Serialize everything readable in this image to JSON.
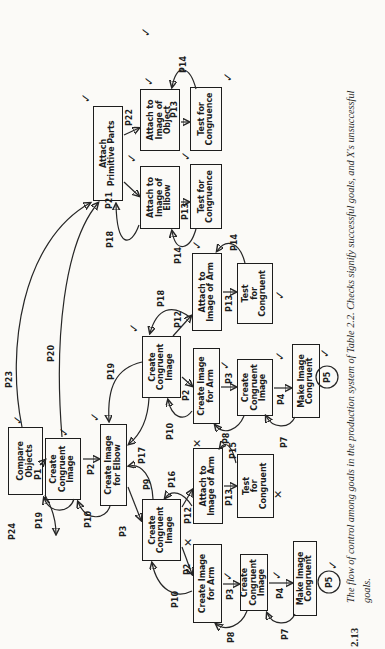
{
  "figure": {
    "number": "2.13",
    "caption_line1": "The flow of control among goals in the production system of Table 2.2. Checks signify successful goals, and X's unsuccessful",
    "caption_line2": "goals."
  },
  "colors": {
    "ink": "#1d1d1d",
    "paper": "#fbfaf7"
  },
  "diagram": {
    "nodes": [
      {
        "id": "compare-objects",
        "label": [
          "Compare",
          "Objects"
        ],
        "x": 154,
        "y": 8,
        "w": 68,
        "h": 35
      },
      {
        "id": "create-congruent-1",
        "label": [
          "Create",
          "Congruent",
          "Image"
        ],
        "x": 149,
        "y": 45,
        "w": 62,
        "h": 36
      },
      {
        "id": "create-image-elbow",
        "label": [
          "Create Image",
          "for Elbow"
        ],
        "x": 143,
        "y": 100,
        "w": 82,
        "h": 27
      },
      {
        "id": "create-congruent-2",
        "label": [
          "Create",
          "Congruent",
          "Image"
        ],
        "x": 88,
        "y": 142,
        "w": 62,
        "h": 39
      },
      {
        "id": "attach-image-arm-fail",
        "label": [
          "Attach to",
          "Image of Arm"
        ],
        "x": 125,
        "y": 193,
        "w": 76,
        "h": 30
      },
      {
        "id": "test-congruent-fail",
        "label": [
          "Test",
          "for",
          "Congruent"
        ],
        "x": 131,
        "y": 237,
        "w": 64,
        "h": 37
      },
      {
        "id": "create-image-arm-1",
        "label": [
          "Create Image",
          "for Arm"
        ],
        "x": 26,
        "y": 193,
        "w": 79,
        "h": 29
      },
      {
        "id": "create-congruent-3",
        "label": [
          "Create",
          "Congruent",
          "Image"
        ],
        "x": 38,
        "y": 240,
        "w": 57,
        "h": 28
      },
      {
        "id": "make-image-congruent-1",
        "label": [
          "Make Image",
          "Congruent"
        ],
        "x": 33,
        "y": 293,
        "w": 75,
        "h": 24
      },
      {
        "id": "create-congruent-4",
        "label": [
          "Create",
          "Congruent",
          "Image"
        ],
        "x": 251,
        "y": 142,
        "w": 62,
        "h": 39
      },
      {
        "id": "create-image-arm-2",
        "label": [
          "Create Image",
          "for Arm"
        ],
        "x": 225,
        "y": 193,
        "w": 76,
        "h": 27
      },
      {
        "id": "create-congruent-5",
        "label": [
          "Create",
          "Congruent",
          "Image"
        ],
        "x": 233,
        "y": 237,
        "w": 57,
        "h": 36
      },
      {
        "id": "make-image-congruent-2",
        "label": [
          "Make Image",
          "Congruent"
        ],
        "x": 231,
        "y": 292,
        "w": 74,
        "h": 28
      },
      {
        "id": "attach-image-arm-ok",
        "label": [
          "Attach to",
          "Image of Arm"
        ],
        "x": 318,
        "y": 192,
        "w": 78,
        "h": 30
      },
      {
        "id": "test-congruent-ok",
        "label": [
          "Test",
          "for",
          "Congruent"
        ],
        "x": 325,
        "y": 237,
        "w": 61,
        "h": 36
      },
      {
        "id": "attach-primitive-parts",
        "label": [
          "Attach",
          "Primitive Parts"
        ],
        "x": 448,
        "y": 93,
        "w": 95,
        "h": 30
      },
      {
        "id": "attach-image-elbow",
        "label": [
          "Attach to",
          "Image of",
          "Elbow"
        ],
        "x": 420,
        "y": 140,
        "w": 63,
        "h": 40
      },
      {
        "id": "test-congruence-elbow",
        "label": [
          "Test for",
          "Congruence"
        ],
        "x": 420,
        "y": 190,
        "w": 65,
        "h": 32
      },
      {
        "id": "attach-image-object",
        "label": [
          "Attach to",
          "Image of",
          "Object"
        ],
        "x": 498,
        "y": 140,
        "w": 62,
        "h": 40
      },
      {
        "id": "test-congruence-object",
        "label": [
          "Test for",
          "Congruence"
        ],
        "x": 498,
        "y": 190,
        "w": 64,
        "h": 32
      }
    ],
    "edges": [
      {
        "name": "P1",
        "d": "M 184 40 L 189 45",
        "lx": 169,
        "ly": 41
      },
      {
        "name": "P2",
        "d": "M 190 83 L 190 99",
        "lx": 174,
        "ly": 94
      },
      {
        "name": "P3",
        "d": "M 162 128 L 129 141",
        "lx": 112,
        "ly": 126
      },
      {
        "name": "P12",
        "d": "M 142 182 L 159 192",
        "lx": 125,
        "ly": 191
      },
      {
        "name": "P13",
        "d": "M 163 224 L 163 236",
        "lx": 143,
        "ly": 232
      },
      {
        "name": "P2",
        "d": "M 102 182 L 75 192",
        "lx": 74,
        "ly": 190
      },
      {
        "name": "P3",
        "d": "M 65 223 L 65 239",
        "lx": 49,
        "ly": 233
      },
      {
        "name": "P4",
        "d": "M 66 269 L 66 292",
        "lx": 50,
        "ly": 283
      },
      {
        "name": "P12",
        "d": "M 313 173 L 333 191",
        "lx": 321,
        "ly": 181
      },
      {
        "name": "P13",
        "d": "M 357 223 L 357 236",
        "lx": 337,
        "ly": 232
      },
      {
        "name": "P2",
        "d": "M 272 182 L 263 192",
        "lx": 248,
        "ly": 189
      },
      {
        "name": "P3",
        "d": "M 262 221 L 262 236",
        "lx": 265,
        "ly": 232
      },
      {
        "name": "P4",
        "d": "M 261 274 L 261 291",
        "lx": 244,
        "ly": 284
      },
      {
        "name": "P21",
        "d": "M 467 124 L 453 139",
        "lx": 440,
        "ly": 112
      },
      {
        "name": "P22",
        "d": "M 514 124 L 521 139",
        "lx": 523,
        "ly": 132
      },
      {
        "name": "P13",
        "d": "M 447 181 L 447 189",
        "lx": 429,
        "ly": 188
      },
      {
        "name": "P13",
        "d": "M 527 181 L 527 189",
        "lx": 531,
        "ly": 177
      },
      {
        "name": "P19",
        "d": "M 150 74 C 136 70 134 50 151 44",
        "lx": 120,
        "ly": 42
      },
      {
        "name": "P10",
        "d": "M 143 110 C 129 106 127 86 147 78",
        "lx": 121,
        "ly": 91
      },
      {
        "name": "P9",
        "d": "M 150 153 C 172 152 186 142 183 129",
        "lx": 159,
        "ly": 150
      },
      {
        "name": "P16",
        "d": "M 143 192 C 157 183 160 172 151 165",
        "lx": 161,
        "ly": 175
      },
      {
        "name": "P15",
        "d": "M 186 236 C 203 232 209 226 201 220",
        "lx": 190,
        "ly": 236
      },
      {
        "name": "P8",
        "d": "M 38 247 C 23 241 17 226 25 216",
        "lx": 6,
        "ly": 234
      },
      {
        "name": "P7",
        "d": "M 35 295 C 22 289 24 272 36 267",
        "lx": 9,
        "ly": 288
      },
      {
        "name": "P8",
        "d": "M 233 244 C 219 238 213 224 224 215",
        "lx": 205,
        "ly": 229
      },
      {
        "name": "P7",
        "d": "M 232 295 C 219 289 221 272 233 266",
        "lx": 201,
        "ly": 287
      },
      {
        "name": "P10",
        "d": "M 58 192 C 50 176 58 158 86 152",
        "lx": 41,
        "ly": 178
      },
      {
        "name": "P10",
        "d": "M 238 192 C 227 184 231 172 249 168",
        "lx": 209,
        "ly": 173
      },
      {
        "name": "P17",
        "d": "M 251 149 C 231 148 215 141 205 129",
        "lx": 185,
        "ly": 145
      },
      {
        "name": "P19",
        "d": "M 287 142 C 281 116 262 107 228 109",
        "lx": 269,
        "ly": 114
      },
      {
        "name": "P18",
        "d": "M 331 191 C 346 172 341 157 316 150",
        "lx": 342,
        "ly": 164
      },
      {
        "name": "P14",
        "d": "M 386 245 C 406 240 412 227 398 217",
        "lx": 398,
        "ly": 237
      },
      {
        "name": "P18",
        "d": "M 424 139 C 402 131 400 117 445 116",
        "lx": 401,
        "ly": 113
      },
      {
        "name": "P14",
        "d": "M 420 196 C 399 190 395 176 418 172",
        "lx": 385,
        "ly": 181
      },
      {
        "name": "P14",
        "d": "M 560 196 C 583 190 587 177 562 172",
        "lx": 576,
        "ly": 186
      },
      {
        "name": "P20",
        "d": "M 212 62 C 310 54 406 64 446 98",
        "lx": 287,
        "ly": 54
      },
      {
        "name": "P23",
        "d": "M 222 22 C 300 6 408 22 446 90",
        "lx": 261,
        "ly": 12
      },
      {
        "name": "P24",
        "d": "M 154 45 C 140 53 127 56 115 56",
        "lx": 109,
        "ly": 15
      }
    ],
    "loops": [
      {
        "name": "P5",
        "cx": 67,
        "cy": 329,
        "r": 11
      },
      {
        "name": "P5",
        "cx": 272,
        "cy": 327,
        "r": 11
      }
    ],
    "marks": [
      {
        "type": "check",
        "x": 224,
        "y": 12
      },
      {
        "type": "check",
        "x": 212,
        "y": 58
      },
      {
        "type": "check",
        "x": 227,
        "y": 89
      },
      {
        "type": "check",
        "x": 316,
        "y": 128
      },
      {
        "type": "check",
        "x": 546,
        "y": 80
      },
      {
        "type": "check",
        "x": 486,
        "y": 126
      },
      {
        "type": "check",
        "x": 488,
        "y": 180
      },
      {
        "type": "check",
        "x": 563,
        "y": 143
      },
      {
        "type": "check",
        "x": 612,
        "y": 140
      },
      {
        "type": "check",
        "x": 567,
        "y": 222
      },
      {
        "type": "check",
        "x": 399,
        "y": 191
      },
      {
        "type": "check",
        "x": 349,
        "y": 274
      },
      {
        "type": "check",
        "x": 68,
        "y": 222
      },
      {
        "type": "check",
        "x": 69,
        "y": 271
      },
      {
        "type": "check",
        "x": 79,
        "y": 327
      },
      {
        "type": "check",
        "x": 279,
        "y": 219
      },
      {
        "type": "check",
        "x": 288,
        "y": 274
      },
      {
        "type": "check",
        "x": 291,
        "y": 319
      },
      {
        "type": "cross",
        "x": 102,
        "y": 183
      },
      {
        "type": "cross",
        "x": 201,
        "y": 192
      },
      {
        "type": "cross",
        "x": 150,
        "y": 273
      }
    ]
  }
}
